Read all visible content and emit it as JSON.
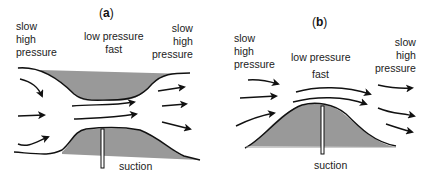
{
  "panels": [
    {
      "id": "a",
      "title_open": "(",
      "title_letter": "a",
      "title_close": ")",
      "left_label": "slow\nhigh\npressure",
      "center_label": "low pressure\nfast",
      "right_label": "slow\nhigh\npressure",
      "bottom_label": "suction"
    },
    {
      "id": "b",
      "title_open": "(",
      "title_letter": "b",
      "title_close": ")",
      "left_label": "slow\nhigh\npressure",
      "center_label_1": "low pressure",
      "center_label_2": "fast",
      "right_label": "slow\nhigh\npressure",
      "bottom_label": "suction"
    }
  ],
  "colors": {
    "fill": "#999999",
    "stroke": "#111111"
  }
}
